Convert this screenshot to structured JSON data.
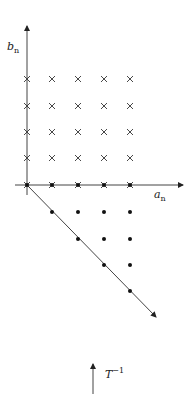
{
  "diagram": {
    "labels": {
      "vertical_axis": "b",
      "vertical_axis_sub": "n",
      "horizontal_axis": "a",
      "horizontal_axis_sub": "n",
      "transform": "T",
      "transform_sup": "−1"
    },
    "crosses": {
      "columns_x": [
        27,
        52,
        78,
        104,
        130
      ],
      "rows_y": [
        79,
        106,
        132,
        158,
        185
      ]
    },
    "dots": [
      [
        27,
        185
      ],
      [
        52,
        185
      ],
      [
        78,
        185
      ],
      [
        104,
        185
      ],
      [
        130,
        185
      ],
      [
        52,
        212
      ],
      [
        78,
        212
      ],
      [
        104,
        212
      ],
      [
        130,
        212
      ],
      [
        78,
        239
      ],
      [
        104,
        239
      ],
      [
        130,
        239
      ],
      [
        104,
        265
      ],
      [
        130,
        265
      ],
      [
        130,
        291
      ]
    ],
    "colors": {
      "ink": "#222222"
    }
  }
}
